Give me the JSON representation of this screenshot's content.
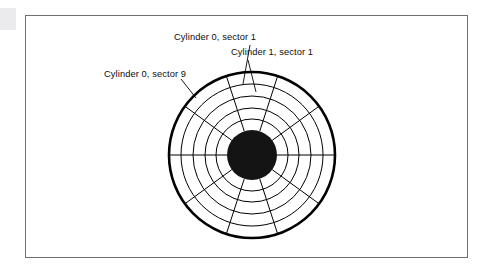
{
  "figure": {
    "kind": "disk-platter-diagram",
    "frame": {
      "x": 25,
      "y": 15,
      "width": 443,
      "height": 243,
      "border_color": "#6d6f72"
    },
    "background_color": "#ffffff",
    "ink_color": "#000000",
    "labels": [
      {
        "id": "cylinder-0-sector-1",
        "text": "Cylinder 0, sector 1",
        "x": 174,
        "y": 33,
        "leader": {
          "from_x": 250,
          "from_y": 45,
          "to_x": 243,
          "to_y": 84
        }
      },
      {
        "id": "cylinder-1-sector-1",
        "text": "Cylinder 1, sector 1",
        "x": 231,
        "y": 48,
        "leader": {
          "from_x": 248,
          "from_y": 60,
          "to_x": 256,
          "to_y": 92
        }
      },
      {
        "id": "cylinder-0-sector-9",
        "text": "Cylinder 0, sector 9",
        "x": 104,
        "y": 70,
        "leader": {
          "from_x": 181,
          "from_y": 79,
          "to_x": 196,
          "to_y": 98
        }
      }
    ],
    "platter": {
      "center_x": 252,
      "center_y": 155,
      "outer_radius": 83,
      "outer_stroke_width": 2.6,
      "hub_radius": 25,
      "hub_fill": "#141414",
      "track_stroke_width": 1.0,
      "track_radii": [
        71,
        59,
        47,
        36
      ],
      "sector_count": 10,
      "sector_angle_degrees": 36,
      "spoke_start_angle_degrees": 0,
      "spoke_inner_radius": 25,
      "spoke_outer_radius": 83
    }
  }
}
